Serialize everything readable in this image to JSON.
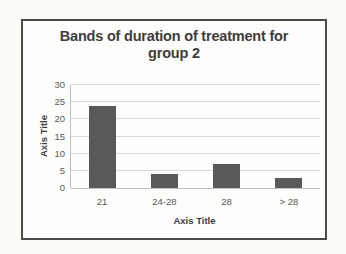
{
  "chart_data": {
    "type": "bar",
    "title": "Bands of duration of treatment for group 2",
    "categories": [
      "21",
      "24-28",
      "28",
      "> 28"
    ],
    "values": [
      24,
      4,
      7,
      3
    ],
    "xlabel": "Axis Title",
    "ylabel": "Axis Title",
    "ylim": [
      0,
      30
    ],
    "yticks": [
      0,
      5,
      10,
      15,
      20,
      25,
      30
    ],
    "grid": true,
    "legend": false,
    "colors": {
      "bar": "#595959",
      "gridline": "#d9d9d9",
      "axis_line": "#bfbfbf",
      "tick_label": "#595959",
      "title_text": "#3d3d3d",
      "frame_border": "#4a4a48"
    }
  }
}
